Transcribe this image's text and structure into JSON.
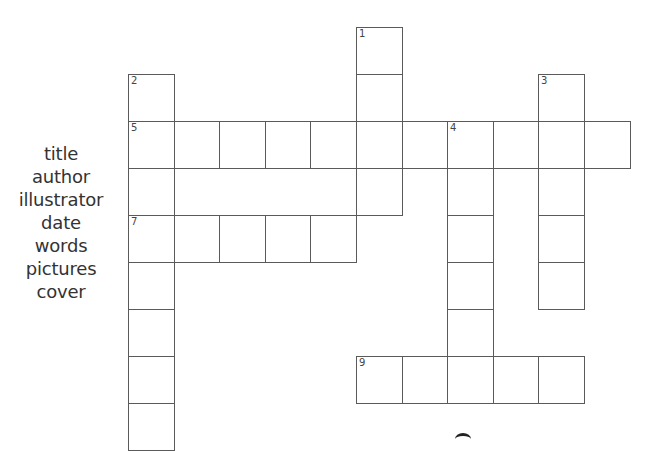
{
  "word_bank": {
    "words": [
      "title",
      "author",
      "illustrator",
      "date",
      "words",
      "pictures",
      "cover"
    ]
  },
  "grid": {
    "origin_x": 128,
    "origin_y": 27,
    "cell_width": 45.6,
    "cell_height": 47,
    "line_color": "#5a5a5a",
    "entries": [
      {
        "number": "1",
        "direction": "down",
        "col": 5,
        "row": 0,
        "length": 4
      },
      {
        "number": "2",
        "direction": "down",
        "col": 0,
        "row": 1,
        "length": 8
      },
      {
        "number": "3",
        "direction": "down",
        "col": 9,
        "row": 1,
        "length": 5
      },
      {
        "number": "4",
        "direction": "down",
        "col": 7,
        "row": 2,
        "length": 6
      },
      {
        "number": "5",
        "direction": "across",
        "col": 0,
        "row": 2,
        "length": 11
      },
      {
        "number": "7",
        "direction": "across",
        "col": 0,
        "row": 4,
        "length": 5
      },
      {
        "number": "9",
        "direction": "across",
        "col": 5,
        "row": 7,
        "length": 5
      }
    ]
  }
}
